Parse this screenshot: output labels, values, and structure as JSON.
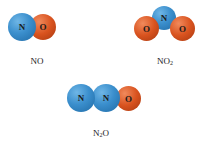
{
  "molecules": [
    {
      "formula": "NO",
      "atoms": [
        "N",
        "O"
      ],
      "colors": {
        "N": "#3b8fcd",
        "O": "#d9531f"
      }
    },
    {
      "formula_base": "NO",
      "formula_sub": "2",
      "atoms": [
        "O",
        "N",
        "O"
      ]
    },
    {
      "formula_pre": "N",
      "formula_sub": "2",
      "formula_post": "O",
      "atoms": [
        "N",
        "N",
        "O"
      ]
    }
  ]
}
